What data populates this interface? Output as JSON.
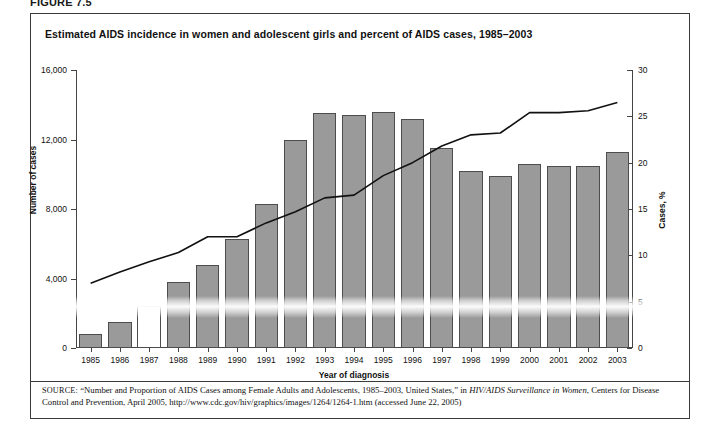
{
  "figure": {
    "label": "FIGURE 7.5",
    "title": "Estimated AIDS incidence in women and adolescent girls and percent of AIDS cases, 1985–2003"
  },
  "source": {
    "prefix": "SOURCE:",
    "quote": "“Number and Proportion of AIDS Cases among Female Adults and Adolescents, 1985–2003, United States,” in ",
    "publication": "HIV/AIDS Surveillance in Women",
    "rest": ", Centers for Disease Control and Prevention, April 2005, http://www.cdc.gov/hiv/graphics/images/1264/1264-1.htm (accessed June 22, 2005)"
  },
  "colors": {
    "bar_fill": "#9a9a9a",
    "bar_stroke": "#4d4d4d",
    "line": "#111111",
    "axis": "#444444",
    "frame": "#3a3a3a"
  },
  "chart_data": {
    "type": "bar",
    "title": "Estimated AIDS incidence in women and adolescent girls and percent of AIDS cases, 1985–2003",
    "xlabel": "Year of diagnosis",
    "ylabel": "Number of cases",
    "y2label": "Cases, %",
    "ylim": [
      0,
      16000
    ],
    "y2lim": [
      0,
      30
    ],
    "yticks": [
      0,
      4000,
      8000,
      12000,
      16000
    ],
    "ytick_labels": [
      "0",
      "4,000",
      "8,000",
      "12,000",
      "16,000"
    ],
    "y2ticks": [
      0,
      5,
      10,
      15,
      20,
      25,
      30
    ],
    "y2tick_labels": [
      "0",
      "5",
      "10",
      "15",
      "20",
      "25",
      "30"
    ],
    "grid": false,
    "legend": "none",
    "categories": [
      "1985",
      "1986",
      "1987",
      "1988",
      "1989",
      "1990",
      "1991",
      "1992",
      "1993",
      "1994",
      "1995",
      "1996",
      "1997",
      "1998",
      "1999",
      "2000",
      "2001",
      "2002",
      "2003"
    ],
    "series": [
      {
        "name": "Number of cases",
        "type": "bar",
        "axis": "left",
        "values": [
          800,
          1500,
          2400,
          3800,
          4800,
          6300,
          8300,
          12000,
          13500,
          13400,
          13600,
          13200,
          11500,
          10200,
          9900,
          10600,
          10500,
          10500,
          11300
        ]
      },
      {
        "name": "Cases, %",
        "type": "line",
        "axis": "right",
        "values": [
          7.0,
          8.2,
          9.3,
          10.3,
          12.0,
          12.0,
          13.5,
          14.7,
          16.2,
          16.5,
          18.6,
          20.0,
          21.8,
          23.0,
          23.2,
          25.4,
          25.4,
          25.6,
          26.5
        ]
      }
    ]
  }
}
